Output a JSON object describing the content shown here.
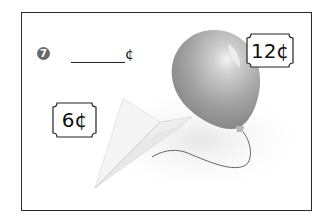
{
  "problem": {
    "number": "7",
    "answer_blank": "",
    "unit": "¢"
  },
  "items": [
    {
      "name": "paper airplane",
      "price_label": "6¢",
      "price": 6
    },
    {
      "name": "balloon",
      "price_label": "12¢",
      "price": 12
    }
  ],
  "colors": {
    "frame": "#2a2a2a",
    "badge": "#6a6a6a",
    "balloon": "#9a9a9a",
    "airplane": "#f2f2f2"
  }
}
